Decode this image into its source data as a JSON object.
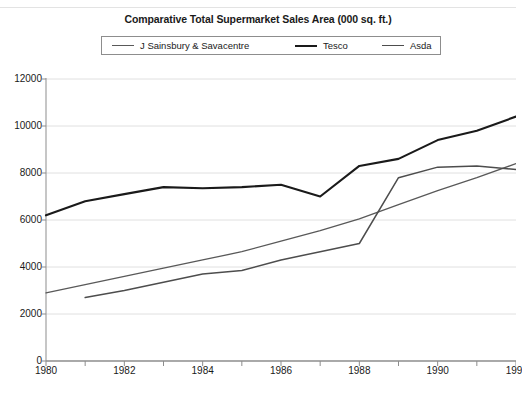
{
  "chart_data": {
    "type": "line",
    "title": "Comparative Total Supermarket Sales Area (000 sq. ft.)",
    "xlabel": "",
    "ylabel": "",
    "xlim": [
      1980,
      1992
    ],
    "ylim": [
      0,
      12000
    ],
    "yticks": [
      0,
      2000,
      4000,
      6000,
      8000,
      10000,
      12000
    ],
    "ytick_labels": [
      "0",
      "2000",
      "4000",
      "6000",
      "8000",
      "10000",
      "12000"
    ],
    "xticks": [
      1980,
      1982,
      1984,
      1986,
      1988,
      1990,
      1992
    ],
    "xtick_labels": [
      "1980",
      "1982",
      "1984",
      "1986",
      "1988",
      "1990",
      "199"
    ],
    "grid": "horizontal",
    "legend_position": "top-center",
    "x": [
      1980,
      1981,
      1982,
      1983,
      1984,
      1985,
      1986,
      1987,
      1988,
      1989,
      1990,
      1991,
      1992
    ],
    "series": [
      {
        "name": "J Sainsbury & Savacentre",
        "color": "#595959",
        "width": 1.3,
        "values": [
          2900,
          3250,
          3600,
          3950,
          4300,
          4650,
          5100,
          5550,
          6050,
          6650,
          7250,
          7800,
          8400
        ]
      },
      {
        "name": "Tesco",
        "color": "#1a1a1a",
        "width": 2.1,
        "values": [
          6200,
          6800,
          7100,
          7400,
          7350,
          7400,
          7500,
          7000,
          8300,
          8600,
          9400,
          9800,
          10400
        ]
      },
      {
        "name": "Asda",
        "color": "#4d4d4d",
        "width": 1.5,
        "values": [
          null,
          2700,
          3000,
          3350,
          3700,
          3850,
          4300,
          4650,
          5000,
          7800,
          8250,
          8300,
          8150
        ]
      }
    ]
  },
  "axes": {
    "plot_left": 46,
    "plot_right": 516,
    "plot_top": 79,
    "plot_bottom": 361
  }
}
